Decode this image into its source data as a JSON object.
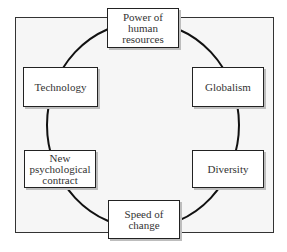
{
  "diagram": {
    "type": "cycle",
    "nodes": [
      {
        "id": "top",
        "label": "Power of\nhuman\nresources"
      },
      {
        "id": "upper-right",
        "label": "Globalism"
      },
      {
        "id": "lower-right",
        "label": "Diversity"
      },
      {
        "id": "bottom",
        "label": "Speed of\nchange"
      },
      {
        "id": "lower-left",
        "label": "New\npsychological\ncontract"
      },
      {
        "id": "upper-left",
        "label": "Technology"
      }
    ]
  }
}
